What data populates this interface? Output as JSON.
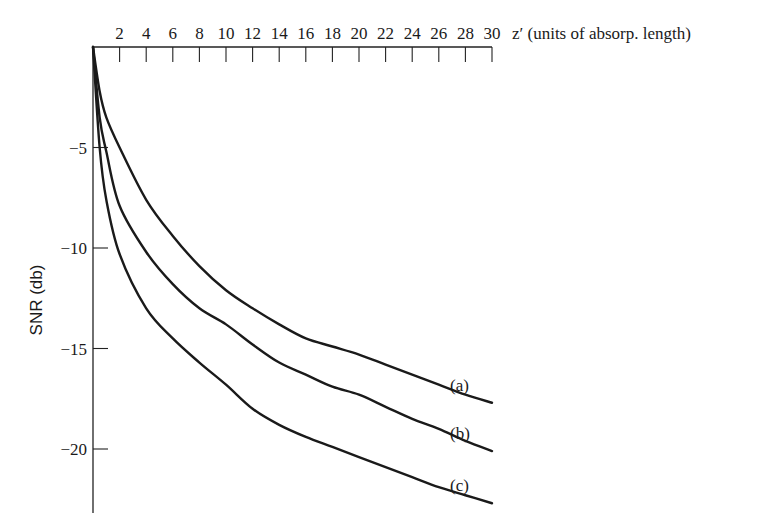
{
  "chart_data": {
    "type": "line",
    "title": "",
    "xlabel": "z′ (units of absorp. length)",
    "ylabel": "SNR (db)",
    "xlim": [
      0,
      30
    ],
    "ylim": [
      -23,
      0
    ],
    "x_axis_position": "top",
    "x_ticks": [
      2,
      4,
      6,
      8,
      10,
      12,
      14,
      16,
      18,
      20,
      22,
      24,
      26,
      28,
      30
    ],
    "y_ticks": [
      -5,
      -10,
      -15,
      -20
    ],
    "grid": false,
    "legend": "inline labels at curve ends",
    "series": [
      {
        "name": "(a)",
        "x": [
          0,
          0.5,
          1,
          2,
          4,
          6,
          8,
          10,
          12,
          14,
          16,
          18,
          20,
          22,
          24,
          26,
          28,
          30
        ],
        "values": [
          0,
          -2.2,
          -3.5,
          -5.0,
          -7.6,
          -9.4,
          -10.9,
          -12.1,
          -13.0,
          -13.8,
          -14.5,
          -14.9,
          -15.3,
          -15.8,
          -16.3,
          -16.8,
          -17.3,
          -17.7
        ]
      },
      {
        "name": "(b)",
        "x": [
          0,
          0.5,
          1,
          2,
          4,
          6,
          8,
          10,
          12,
          14,
          16,
          18,
          20,
          22,
          24,
          26,
          28,
          30
        ],
        "values": [
          0,
          -3.5,
          -5.2,
          -7.9,
          -10.2,
          -11.8,
          -13.0,
          -13.8,
          -14.8,
          -15.7,
          -16.3,
          -16.9,
          -17.3,
          -17.9,
          -18.5,
          -19.0,
          -19.6,
          -20.1
        ]
      },
      {
        "name": "(c)",
        "x": [
          0,
          0.5,
          1,
          2,
          4,
          6,
          8,
          10,
          12,
          14,
          16,
          18,
          20,
          22,
          24,
          26,
          28,
          30
        ],
        "values": [
          0,
          -5.0,
          -7.6,
          -10.3,
          -13.0,
          -14.5,
          -15.7,
          -16.8,
          -18.0,
          -18.8,
          -19.4,
          -19.9,
          -20.4,
          -20.9,
          -21.4,
          -21.9,
          -22.3,
          -22.7
        ]
      }
    ]
  },
  "axes": {
    "x_title": "z′ (units of absorp. length)",
    "y_title": "SNR (db)",
    "x_tick_labels": [
      "2",
      "4",
      "6",
      "8",
      "10",
      "12",
      "14",
      "16",
      "18",
      "20",
      "22",
      "24",
      "26",
      "28",
      "30"
    ],
    "y_tick_labels": [
      "−5",
      "−10",
      "−15",
      "−20"
    ]
  },
  "curve_labels": [
    "(a)",
    "(b)",
    "(c)"
  ]
}
